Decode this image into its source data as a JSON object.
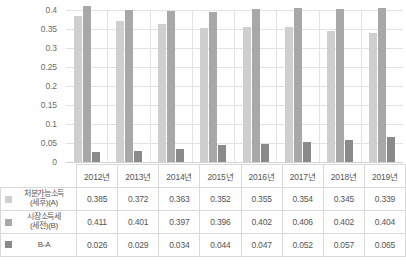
{
  "chart_data": {
    "type": "bar",
    "title": "",
    "subtitle": "",
    "xlabel": "",
    "ylabel": "",
    "ylim": [
      0,
      0.4
    ],
    "grid": true,
    "legend_position": "table-left",
    "categories": [
      "2012년",
      "2013년",
      "2014년",
      "2015년",
      "2016년",
      "2017년",
      "2018년",
      "2019년"
    ],
    "y_ticks": [
      "0.4",
      "0.35",
      "0.3",
      "0.25",
      "0.2",
      "0.15",
      "0.1",
      "0.05",
      "0"
    ],
    "y_tick_values": [
      0.4,
      0.35,
      0.3,
      0.25,
      0.2,
      0.15,
      0.1,
      0.05,
      0
    ],
    "series": [
      {
        "name": "처분가능소득(세후)(A)",
        "name_line1": "처분가능소득",
        "name_line2": "(세후)(A)",
        "color": "#cfcfcf",
        "values": [
          0.385,
          0.372,
          0.363,
          0.352,
          0.355,
          0.354,
          0.345,
          0.339
        ],
        "labels": [
          "0.385",
          "0.372",
          "0.363",
          "0.352",
          "0.355",
          "0.354",
          "0.345",
          "0.339"
        ]
      },
      {
        "name": "시장소득세(세전)(B)",
        "name_line1": "시장소득세",
        "name_line2": "(세전)(B)",
        "color": "#a8a8a8",
        "values": [
          0.411,
          0.401,
          0.397,
          0.396,
          0.402,
          0.406,
          0.402,
          0.404
        ],
        "labels": [
          "0.411",
          "0.401",
          "0.397",
          "0.396",
          "0.402",
          "0.406",
          "0.402",
          "0.404"
        ]
      },
      {
        "name": "B-A",
        "name_line1": "B-A",
        "name_line2": "",
        "color": "#8a8a8a",
        "values": [
          0.026,
          0.029,
          0.034,
          0.044,
          0.047,
          0.052,
          0.057,
          0.065
        ],
        "labels": [
          "0.026",
          "0.029",
          "0.034",
          "0.044",
          "0.047",
          "0.052",
          "0.057",
          "0.065"
        ]
      }
    ]
  },
  "colors": {
    "series_a": "#cfcfcf",
    "series_b": "#a8a8a8",
    "series_diff": "#8a8a8a",
    "gridline": "#e2e2e2",
    "table_border": "#d9d9d9",
    "text": "#555555",
    "background": "#ffffff"
  }
}
